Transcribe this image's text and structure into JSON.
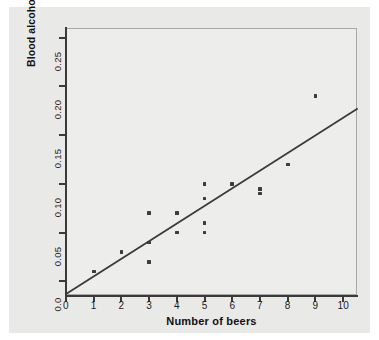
{
  "chart_data": {
    "type": "scatter",
    "title": "",
    "xlabel": "Number of beers",
    "ylabel": "Blood alcohol content",
    "xlim": [
      0,
      10.5
    ],
    "ylim": [
      -0.015,
      0.26
    ],
    "grid": false,
    "legend": "none",
    "x_ticks": [
      "0",
      "1",
      "2",
      "3",
      "4",
      "5",
      "6",
      "7",
      "8",
      "9",
      "10"
    ],
    "x_tick_values": [
      0,
      1,
      2,
      3,
      4,
      5,
      6,
      7,
      8,
      9,
      10
    ],
    "y_ticks": [
      "0.0",
      "0.05",
      "0.10",
      "0.15",
      "0.20",
      "0.25"
    ],
    "y_tick_values": [
      0.0,
      0.05,
      0.1,
      0.15,
      0.2,
      0.25
    ],
    "marker_color": "#3c3c3c",
    "line_color": "#3a3a3a",
    "points": [
      {
        "x": 1,
        "y": 0.01
      },
      {
        "x": 2,
        "y": 0.03
      },
      {
        "x": 3,
        "y": 0.07
      },
      {
        "x": 3,
        "y": 0.04
      },
      {
        "x": 3,
        "y": 0.02
      },
      {
        "x": 4,
        "y": 0.07
      },
      {
        "x": 4,
        "y": 0.05
      },
      {
        "x": 5,
        "y": 0.1
      },
      {
        "x": 5,
        "y": 0.085
      },
      {
        "x": 5,
        "y": 0.06
      },
      {
        "x": 5,
        "y": 0.05
      },
      {
        "x": 6,
        "y": 0.1
      },
      {
        "x": 7,
        "y": 0.095
      },
      {
        "x": 7,
        "y": 0.09
      },
      {
        "x": 8,
        "y": 0.12
      },
      {
        "x": 9,
        "y": 0.19
      }
    ],
    "fit_line": {
      "type": "least-squares-regression",
      "x_start": 0.0,
      "y_start": -0.013,
      "x_end": 10.5,
      "y_end": 0.177
    }
  },
  "figure": {
    "panel_color": "#e9e9e7",
    "plot_background": "#ededeb"
  }
}
